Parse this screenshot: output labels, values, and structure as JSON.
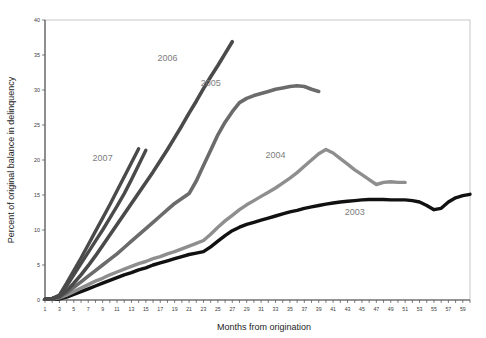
{
  "chart_data": {
    "type": "line",
    "title": "",
    "xlabel": "Months from origination",
    "ylabel": "Percent of original balance in delinquency",
    "xlim": [
      1,
      60
    ],
    "ylim": [
      0,
      40
    ],
    "ytick_step": 5,
    "yticks": [
      0,
      5,
      10,
      15,
      20,
      25,
      30,
      35,
      40
    ],
    "xticks": [
      1,
      3,
      5,
      7,
      9,
      11,
      13,
      15,
      17,
      19,
      21,
      23,
      25,
      27,
      29,
      31,
      33,
      35,
      37,
      39,
      41,
      43,
      45,
      47,
      49,
      51,
      53,
      55,
      57,
      59
    ],
    "grid": false,
    "legend": "inline-labels",
    "series": [
      {
        "name": "2003",
        "label": "2003",
        "color": "#111111",
        "width": 3.4,
        "label_x": 44,
        "label_y": 12.1,
        "x": [
          1,
          2,
          3,
          4,
          5,
          6,
          7,
          8,
          9,
          10,
          11,
          12,
          13,
          14,
          15,
          16,
          17,
          18,
          19,
          20,
          21,
          22,
          23,
          24,
          25,
          26,
          27,
          28,
          29,
          30,
          31,
          32,
          33,
          34,
          35,
          36,
          37,
          38,
          39,
          40,
          41,
          42,
          43,
          44,
          45,
          46,
          47,
          48,
          49,
          50,
          51,
          52,
          53,
          54,
          55,
          56,
          57,
          58,
          59,
          60
        ],
        "y": [
          0.1,
          0.1,
          0.15,
          0.4,
          0.8,
          1.2,
          1.6,
          2.0,
          2.4,
          2.8,
          3.2,
          3.6,
          3.9,
          4.3,
          4.6,
          5.0,
          5.3,
          5.6,
          5.9,
          6.2,
          6.5,
          6.7,
          6.9,
          7.6,
          8.4,
          9.2,
          9.9,
          10.4,
          10.8,
          11.1,
          11.4,
          11.7,
          12.0,
          12.3,
          12.6,
          12.8,
          13.1,
          13.3,
          13.5,
          13.7,
          13.85,
          14.0,
          14.1,
          14.2,
          14.3,
          14.35,
          14.35,
          14.35,
          14.3,
          14.3,
          14.3,
          14.2,
          14.0,
          13.5,
          12.9,
          13.1,
          14.0,
          14.6,
          14.9,
          15.1
        ]
      },
      {
        "name": "2004",
        "label": "2004",
        "color": "#8e8e8e",
        "width": 3.4,
        "label_x": 33,
        "label_y": 20.3,
        "x": [
          1,
          2,
          3,
          4,
          5,
          6,
          7,
          8,
          9,
          10,
          11,
          12,
          13,
          14,
          15,
          16,
          17,
          18,
          19,
          20,
          21,
          22,
          23,
          24,
          25,
          26,
          27,
          28,
          29,
          30,
          31,
          32,
          33,
          34,
          35,
          36,
          37,
          38,
          39,
          40,
          41,
          42,
          43,
          44,
          45,
          46,
          47,
          48,
          49,
          50,
          51
        ],
        "y": [
          0.1,
          0.15,
          0.3,
          0.7,
          1.2,
          1.7,
          2.2,
          2.7,
          3.1,
          3.6,
          4.0,
          4.4,
          4.8,
          5.2,
          5.5,
          5.9,
          6.2,
          6.6,
          6.9,
          7.3,
          7.7,
          8.1,
          8.5,
          9.4,
          10.4,
          11.3,
          12.1,
          12.9,
          13.6,
          14.2,
          14.8,
          15.4,
          16.0,
          16.7,
          17.4,
          18.2,
          19.1,
          20.0,
          20.9,
          21.5,
          21.0,
          20.2,
          19.4,
          18.6,
          17.9,
          17.2,
          16.5,
          16.8,
          16.9,
          16.8,
          16.8
        ]
      },
      {
        "name": "2005",
        "label": "2005",
        "color": "#6b6b6b",
        "width": 3.6,
        "label_x": 24,
        "label_y": 30.6,
        "x": [
          1,
          2,
          3,
          4,
          5,
          6,
          7,
          8,
          9,
          10,
          11,
          12,
          13,
          14,
          15,
          16,
          17,
          18,
          19,
          20,
          21,
          22,
          23,
          24,
          25,
          26,
          27,
          28,
          29,
          30,
          31,
          32,
          33,
          34,
          35,
          36,
          37,
          38,
          39
        ],
        "y": [
          0.1,
          0.2,
          0.4,
          1.0,
          1.8,
          2.6,
          3.4,
          4.2,
          5.0,
          5.8,
          6.6,
          7.5,
          8.4,
          9.3,
          10.2,
          11.1,
          12.0,
          12.9,
          13.8,
          14.5,
          15.2,
          17.0,
          19.2,
          21.4,
          23.6,
          25.4,
          26.9,
          28.2,
          28.8,
          29.2,
          29.5,
          29.8,
          30.1,
          30.3,
          30.5,
          30.6,
          30.5,
          30.1,
          29.8
        ]
      },
      {
        "name": "2006",
        "label": "2006",
        "color": "#4a4a4a",
        "width": 3.6,
        "label_x": 18,
        "label_y": 34.2,
        "x": [
          1,
          2,
          3,
          4,
          5,
          6,
          7,
          8,
          9,
          10,
          11,
          12,
          13,
          14,
          15,
          16,
          17,
          18,
          19,
          20,
          21,
          22,
          23,
          24,
          25,
          26,
          27
        ],
        "y": [
          0.1,
          0.2,
          0.5,
          1.3,
          2.4,
          3.6,
          4.9,
          6.3,
          7.8,
          9.3,
          10.8,
          12.3,
          13.8,
          15.3,
          16.8,
          18.3,
          19.9,
          21.5,
          23.2,
          24.9,
          26.7,
          28.4,
          30.2,
          31.9,
          33.5,
          35.2,
          36.9
        ]
      },
      {
        "name": "2007",
        "label": "2007",
        "color": "#4a4a4a",
        "width": 3.4,
        "label_x": 9,
        "label_y": 19.8,
        "x": [
          1,
          2,
          3,
          4,
          5,
          6,
          7,
          8,
          9,
          10,
          11,
          12,
          13,
          14,
          15
        ],
        "y": [
          0.1,
          0.2,
          0.6,
          2.0,
          3.6,
          5.2,
          6.8,
          8.4,
          10.0,
          11.7,
          13.4,
          15.2,
          17.2,
          19.3,
          21.4
        ]
      },
      {
        "name": "2008",
        "label": "",
        "color": "#4a4a4a",
        "width": 3.4,
        "label_x": null,
        "label_y": null,
        "x": [
          1,
          2,
          3,
          4,
          5,
          6,
          7,
          8,
          9,
          10,
          11,
          12,
          13,
          14
        ],
        "y": [
          0.1,
          0.2,
          0.7,
          2.4,
          4.2,
          6.0,
          7.9,
          9.8,
          11.7,
          13.6,
          15.6,
          17.6,
          19.6,
          21.6
        ]
      }
    ]
  },
  "axes": {
    "x_axis_title": "Months from origination",
    "y_axis_title": "Percent of original balance  in delinquency"
  },
  "colors": {
    "series_2003": "#111111",
    "series_2004": "#8e8e8e",
    "series_2005": "#6b6b6b",
    "series_2006": "#4a4a4a",
    "series_2007": "#4a4a4a",
    "frame": "#b9b9b9",
    "axis": "#4a4a4a",
    "label_text": "#7d7d7d",
    "background": "#ffffff"
  }
}
